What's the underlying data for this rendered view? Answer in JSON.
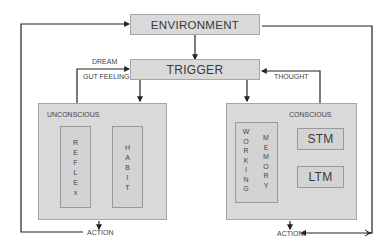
{
  "diagram": {
    "environment": {
      "label": "ENVIRONMENT"
    },
    "trigger": {
      "label": "TRIGGER"
    },
    "left_feedback": {
      "label_top": "DREAM",
      "label_bottom": "GUT FEELING"
    },
    "right_feedback": {
      "label": "THOUGHT"
    },
    "unconscious": {
      "label": "UNCONSCIOUS",
      "children": [
        {
          "label": "R E F L E x",
          "letters": [
            "R",
            "E",
            "F",
            "L",
            "E",
            "x"
          ]
        },
        {
          "label": "H A B I T",
          "letters": [
            "H",
            "A",
            "B",
            "I",
            "T"
          ]
        }
      ]
    },
    "conscious": {
      "label": "CONSCIOUS",
      "working_memory": {
        "col1": [
          "W",
          "O",
          "R",
          "K",
          "I",
          "N",
          "G"
        ],
        "col2": [
          "M",
          "E",
          "M",
          "O",
          "R",
          "Y"
        ]
      },
      "stm": {
        "label": "STM"
      },
      "ltm": {
        "label": "LTM"
      }
    },
    "action_left": {
      "label": "ACTION"
    },
    "action_right": {
      "label": "ACTION"
    },
    "colors": {
      "box_fill": "#d9d9d9",
      "box_border": "#a6a6a6",
      "line": "#222222",
      "text": "#3a3a3a"
    }
  }
}
